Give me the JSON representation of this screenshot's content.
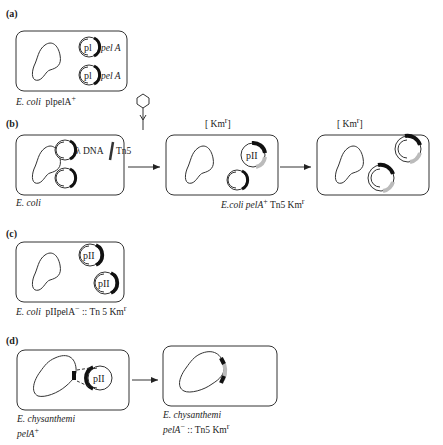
{
  "panels": {
    "a": {
      "label": "(a)",
      "plasmid_labels": [
        "pl",
        "pl"
      ],
      "gene_labels": [
        "pel A",
        "pel A"
      ],
      "caption_organism": "E. coli",
      "caption_rest": "plpelA",
      "caption_sup": "+"
    },
    "b": {
      "label": "(b)",
      "insert_label": "λ DNA",
      "transposon_label": "Tn5",
      "caption_left": "E. coli",
      "selection_1": "[ Km",
      "selection_1_sup": "r",
      "selection_1_end": "]",
      "selection_2": "[ Km",
      "selection_2_sup": "r",
      "selection_2_end": "]",
      "middle_plasmid_label": "pII",
      "caption_mid_organism": "E.coli pelA",
      "caption_mid_sup": "+",
      "caption_mid_rest": "Tn5 Km",
      "caption_mid_sup2": "r"
    },
    "c": {
      "label": "(c)",
      "plasmid_labels": [
        "pII",
        "pII"
      ],
      "caption_organism": "E. coli",
      "caption_rest": "pIIpelA",
      "caption_sup": "−",
      "caption_tail": ":: Tn 5 Km",
      "caption_sup2": "r"
    },
    "d": {
      "label": "(d)",
      "plasmid_label": "pII",
      "caption_left_1": "E. chysanthemi",
      "caption_left_2": "pelA",
      "caption_left_sup": "+",
      "caption_right_1": "E. chysanthemi",
      "caption_right_2": "pelA",
      "caption_right_sup": "−",
      "caption_right_tail": ":: Tn5 Km",
      "caption_right_sup2": "r"
    }
  },
  "colors": {
    "line": "#333333",
    "marker": "#111111",
    "insert_gray": "#bbbbbb"
  }
}
